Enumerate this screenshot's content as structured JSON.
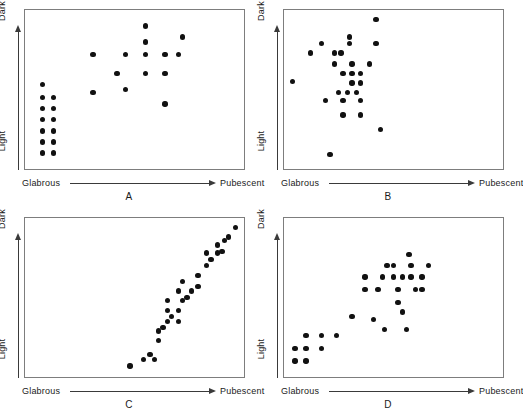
{
  "figure": {
    "axis": {
      "x_left_label": "Glabrous",
      "x_right_label": "Pubescent",
      "y_bottom_label": "Light",
      "y_top_label": "Dark"
    },
    "dot_color": "#111111",
    "frame_color": "#7d7d7d",
    "axis_color": "#3a3a3a"
  },
  "chart_data": [
    {
      "type": "scatter",
      "panel": "A",
      "title": "A",
      "xlabel": "Glabrous → Pubescent",
      "ylabel": "Light → Dark",
      "xlim": [
        0,
        100
      ],
      "ylim": [
        0,
        100
      ],
      "grid": false,
      "legend": "none",
      "n_points": 27,
      "description": "Two discrete groups: a dense low-pubescence light-coloured cluster plus a diffuse high-pubescence darker swarm",
      "points": [
        [
          8,
          53
        ],
        [
          8,
          45
        ],
        [
          13,
          45
        ],
        [
          8,
          38
        ],
        [
          13,
          38
        ],
        [
          8,
          31
        ],
        [
          13,
          31
        ],
        [
          8,
          24
        ],
        [
          13,
          24
        ],
        [
          8,
          17
        ],
        [
          13,
          17
        ],
        [
          8,
          10
        ],
        [
          13,
          10
        ],
        [
          31,
          72
        ],
        [
          31,
          48
        ],
        [
          46,
          72
        ],
        [
          46,
          50
        ],
        [
          55,
          90
        ],
        [
          55,
          80
        ],
        [
          55,
          72
        ],
        [
          55,
          60
        ],
        [
          64,
          72
        ],
        [
          64,
          60
        ],
        [
          64,
          41
        ],
        [
          70,
          72
        ],
        [
          72,
          83
        ],
        [
          42,
          60
        ]
      ]
    },
    {
      "type": "scatter",
      "panel": "B",
      "title": "B",
      "xlabel": "Glabrous → Pubescent",
      "ylabel": "Light → Dark",
      "xlim": [
        0,
        100
      ],
      "ylim": [
        0,
        100
      ],
      "grid": false,
      "legend": "none",
      "n_points": 27,
      "description": "Single unstructured cloud centred mid-range; no apparent trend between pubescence and colour",
      "points": [
        [
          42,
          94
        ],
        [
          30,
          83
        ],
        [
          17,
          79
        ],
        [
          30,
          79
        ],
        [
          42,
          79
        ],
        [
          12,
          73
        ],
        [
          23,
          73
        ],
        [
          26,
          73
        ],
        [
          4,
          55
        ],
        [
          23,
          66
        ],
        [
          31,
          66
        ],
        [
          39,
          66
        ],
        [
          27,
          60
        ],
        [
          31,
          60
        ],
        [
          35,
          60
        ],
        [
          31,
          54
        ],
        [
          35,
          54
        ],
        [
          19,
          43
        ],
        [
          27,
          43
        ],
        [
          35,
          43
        ],
        [
          27,
          34
        ],
        [
          35,
          34
        ],
        [
          44,
          25
        ],
        [
          21,
          9
        ],
        [
          25,
          48
        ],
        [
          29,
          48
        ],
        [
          33,
          48
        ]
      ]
    },
    {
      "type": "scatter",
      "panel": "C",
      "title": "C",
      "xlabel": "Glabrous → Pubescent",
      "ylabel": "Light → Dark",
      "xlim": [
        0,
        100
      ],
      "ylim": [
        0,
        100
      ],
      "grid": false,
      "legend": "none",
      "n_points": 29,
      "description": "Very strong positive linear association: pubescence increases tightly with darkness",
      "points": [
        [
          48,
          7
        ],
        [
          54,
          11
        ],
        [
          59,
          11
        ],
        [
          61,
          23
        ],
        [
          61,
          29
        ],
        [
          65,
          35
        ],
        [
          70,
          35
        ],
        [
          65,
          42
        ],
        [
          70,
          42
        ],
        [
          65,
          48
        ],
        [
          72,
          48
        ],
        [
          70,
          54
        ],
        [
          76,
          54
        ],
        [
          72,
          60
        ],
        [
          79,
          57
        ],
        [
          79,
          64
        ],
        [
          83,
          70
        ],
        [
          85,
          74
        ],
        [
          83,
          78
        ],
        [
          88,
          78
        ],
        [
          88,
          83
        ],
        [
          90,
          79
        ],
        [
          91,
          86
        ],
        [
          93,
          88
        ],
        [
          96,
          94
        ],
        [
          74,
          50
        ],
        [
          67,
          38
        ],
        [
          63,
          31
        ],
        [
          57,
          14
        ]
      ]
    },
    {
      "type": "scatter",
      "panel": "D",
      "title": "D",
      "xlabel": "Glabrous → Pubescent",
      "ylabel": "Light → Dark",
      "xlim": [
        0,
        100
      ],
      "ylim": [
        0,
        100
      ],
      "grid": false,
      "legend": "none",
      "n_points": 30,
      "description": "Moderate positive association with substantial scatter about the trend",
      "points": [
        [
          5,
          10
        ],
        [
          10,
          10
        ],
        [
          5,
          18
        ],
        [
          10,
          18
        ],
        [
          17,
          18
        ],
        [
          10,
          26
        ],
        [
          17,
          26
        ],
        [
          24,
          26
        ],
        [
          31,
          38
        ],
        [
          41,
          36
        ],
        [
          46,
          30
        ],
        [
          37,
          55
        ],
        [
          43,
          55
        ],
        [
          52,
          55
        ],
        [
          37,
          63
        ],
        [
          50,
          63
        ],
        [
          58,
          63
        ],
        [
          63,
          63
        ],
        [
          50,
          70
        ],
        [
          58,
          70
        ],
        [
          66,
          70
        ],
        [
          52,
          47
        ],
        [
          54,
          41
        ],
        [
          57,
          77
        ],
        [
          60,
          55
        ],
        [
          45,
          63
        ],
        [
          47,
          70
        ],
        [
          54,
          63
        ],
        [
          63,
          55
        ],
        [
          56,
          30
        ]
      ]
    }
  ]
}
